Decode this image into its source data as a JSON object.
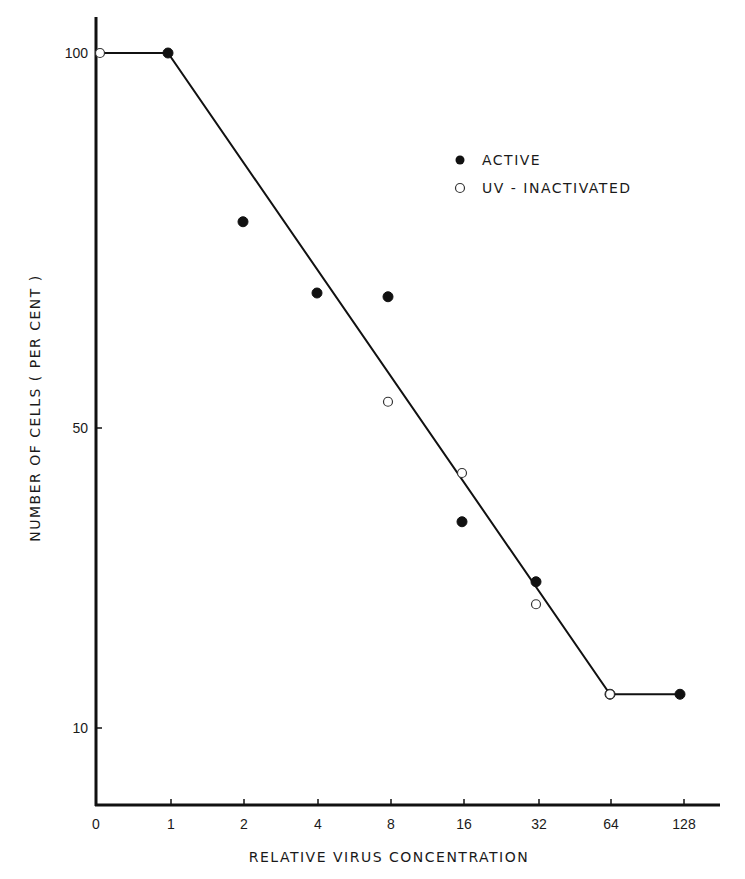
{
  "chart_data": {
    "type": "scatter",
    "title": "",
    "xlabel": "RELATIVE VIRUS CONCENTRATION",
    "ylabel": "NUMBER OF CELLS ( PER CENT )",
    "x_scale": "categorical (log2-spaced)",
    "categories": [
      "0",
      "1",
      "2",
      "4",
      "8",
      "16",
      "32",
      "64",
      "128"
    ],
    "y_ticks": [
      10,
      50,
      100
    ],
    "ylim": [
      0,
      105
    ],
    "grid": false,
    "legend_position": "upper right",
    "legend": [
      {
        "label": "ACTIVE",
        "marker": "filled-circle"
      },
      {
        "label": "UV - INACTIVATED",
        "marker": "open-circle"
      }
    ],
    "series": [
      {
        "name": "ACTIVE",
        "marker": "filled-circle",
        "points": [
          {
            "x": "1",
            "y": 100
          },
          {
            "x": "2",
            "y": 77.5
          },
          {
            "x": "4",
            "y": 68
          },
          {
            "x": "8",
            "y": 67.5
          },
          {
            "x": "16",
            "y": 37.5
          },
          {
            "x": "32",
            "y": 29.5
          },
          {
            "x": "64",
            "y": 14.5
          },
          {
            "x": "128",
            "y": 14.5
          }
        ]
      },
      {
        "name": "UV - INACTIVATED",
        "marker": "open-circle",
        "points": [
          {
            "x": "0",
            "y": 100
          },
          {
            "x": "8",
            "y": 53.5
          },
          {
            "x": "16",
            "y": 44
          },
          {
            "x": "32",
            "y": 26.5
          },
          {
            "x": "64",
            "y": 14.5
          }
        ]
      }
    ],
    "fit_line": {
      "name": "fitted curve",
      "points": [
        {
          "x": "0",
          "y": 100
        },
        {
          "x": "1",
          "y": 100
        },
        {
          "x": "64",
          "y": 14.5
        },
        {
          "x": "128",
          "y": 14.5
        }
      ]
    }
  },
  "layout": {
    "x_positions": {
      "0": 100,
      "1": 168,
      "2": 243,
      "4": 317,
      "8": 388,
      "16": 462,
      "32": 536,
      "64": 610,
      "128": 680
    },
    "x_tick_positions": {
      "0": 96,
      "1": 171,
      "2": 244,
      "4": 318,
      "8": 391,
      "16": 464,
      "32": 539,
      "64": 611,
      "128": 684
    },
    "y_pixel_at_100": 53,
    "y_pixel_per_unit": 7.5,
    "axis_left": 96,
    "axis_top": 17,
    "axis_bottom": 805,
    "axis_right": 720
  },
  "colors": {
    "ink": "#111111",
    "background": "#ffffff"
  }
}
